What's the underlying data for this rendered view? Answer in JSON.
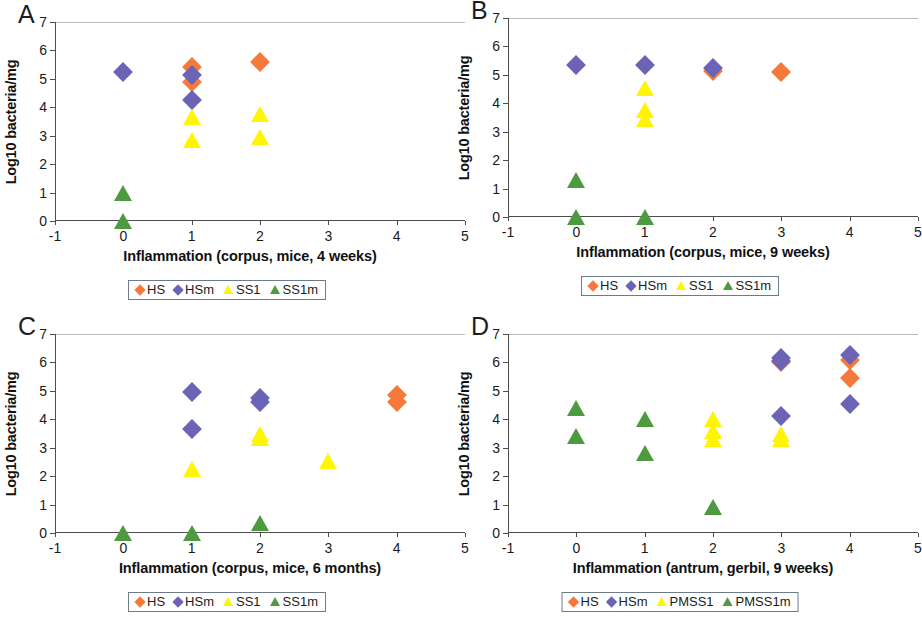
{
  "figure": {
    "panel_letters": [
      "A",
      "B",
      "C",
      "D"
    ]
  },
  "colors": {
    "HS": "#F4793B",
    "HSm": "#6B63B5",
    "SS1": "#FFF500",
    "SS1m": "#4E9A3F",
    "axis": "#4d4d4d",
    "legend_border": "#6b7b8c"
  },
  "axes": {
    "ylabel": "Log10 bacteria/mg",
    "yticks": [
      0,
      1,
      2,
      3,
      4,
      5,
      6,
      7
    ],
    "ylim": [
      0,
      7
    ],
    "xticks": [
      -1,
      0,
      1,
      2,
      3,
      4,
      5
    ],
    "xlim": [
      -1,
      5
    ]
  },
  "chart_data": [
    {
      "type": "scatter",
      "panel": "A",
      "title": "",
      "xlabel": "Inflammation (corpus, mice, 4 weeks)",
      "ylabel": "Log10 bacteria/mg",
      "xlim": [
        -1,
        5
      ],
      "ylim": [
        0,
        7
      ],
      "xticks": [
        -1,
        0,
        1,
        2,
        3,
        4,
        5
      ],
      "yticks": [
        0,
        1,
        2,
        3,
        4,
        5,
        6,
        7
      ],
      "grid": false,
      "legend_position": "below",
      "series": [
        {
          "name": "HS",
          "marker": "diamond",
          "color": "#F4793B",
          "points": [
            [
              1,
              5.4
            ],
            [
              1,
              4.9
            ],
            [
              2,
              5.6
            ]
          ]
        },
        {
          "name": "HSm",
          "marker": "diamond",
          "color": "#6B63B5",
          "points": [
            [
              0,
              5.25
            ],
            [
              1,
              5.15
            ],
            [
              1,
              4.25
            ]
          ]
        },
        {
          "name": "SS1",
          "marker": "triangle",
          "color": "#FFF500",
          "points": [
            [
              1,
              3.65
            ],
            [
              1,
              2.85
            ],
            [
              2,
              3.75
            ],
            [
              2,
              2.95
            ]
          ]
        },
        {
          "name": "SS1m",
          "marker": "triangle",
          "color": "#4E9A3F",
          "points": [
            [
              0,
              1.0
            ],
            [
              0,
              0.0
            ]
          ]
        }
      ]
    },
    {
      "type": "scatter",
      "panel": "B",
      "title": "",
      "xlabel": "Inflammation (corpus, mice, 9 weeks)",
      "ylabel": "Log10 bacteria/mg",
      "xlim": [
        -1,
        5
      ],
      "ylim": [
        0,
        7
      ],
      "xticks": [
        -1,
        0,
        1,
        2,
        3,
        4,
        5
      ],
      "yticks": [
        0,
        1,
        2,
        3,
        4,
        5,
        6,
        7
      ],
      "grid": false,
      "legend_position": "below",
      "series": [
        {
          "name": "HS",
          "marker": "diamond",
          "color": "#F4793B",
          "points": [
            [
              2,
              5.15
            ],
            [
              3,
              5.1
            ]
          ]
        },
        {
          "name": "HSm",
          "marker": "diamond",
          "color": "#6B63B5",
          "points": [
            [
              0,
              5.35
            ],
            [
              1,
              5.35
            ],
            [
              2,
              5.25
            ]
          ]
        },
        {
          "name": "SS1",
          "marker": "triangle",
          "color": "#FFF500",
          "points": [
            [
              1,
              4.55
            ],
            [
              1,
              3.75
            ],
            [
              1,
              3.45
            ]
          ]
        },
        {
          "name": "SS1m",
          "marker": "triangle",
          "color": "#4E9A3F",
          "points": [
            [
              0,
              1.3
            ],
            [
              0,
              0.0
            ],
            [
              1,
              0.0
            ]
          ]
        }
      ]
    },
    {
      "type": "scatter",
      "panel": "C",
      "title": "",
      "xlabel": "Inflammation (corpus, mice, 6 months)",
      "ylabel": "Log10 bacteria/mg",
      "xlim": [
        -1,
        5
      ],
      "ylim": [
        0,
        7
      ],
      "xticks": [
        -1,
        0,
        1,
        2,
        3,
        4,
        5
      ],
      "yticks": [
        0,
        1,
        2,
        3,
        4,
        5,
        6,
        7
      ],
      "grid": false,
      "legend_position": "below",
      "series": [
        {
          "name": "HS",
          "marker": "diamond",
          "color": "#F4793B",
          "points": [
            [
              4,
              4.85
            ],
            [
              4,
              4.6
            ]
          ]
        },
        {
          "name": "HSm",
          "marker": "diamond",
          "color": "#6B63B5",
          "points": [
            [
              1,
              4.95
            ],
            [
              1,
              3.65
            ],
            [
              2,
              4.75
            ],
            [
              2,
              4.6
            ]
          ]
        },
        {
          "name": "SS1",
          "marker": "triangle",
          "color": "#FFF500",
          "points": [
            [
              1,
              2.25
            ],
            [
              2,
              3.5
            ],
            [
              2,
              3.35
            ],
            [
              3,
              2.55
            ]
          ]
        },
        {
          "name": "SS1m",
          "marker": "triangle",
          "color": "#4E9A3F",
          "points": [
            [
              0,
              0.0
            ],
            [
              1,
              0.0
            ],
            [
              2,
              0.35
            ]
          ]
        }
      ]
    },
    {
      "type": "scatter",
      "panel": "D",
      "title": "",
      "xlabel": "Inflammation (antrum, gerbil, 9 weeks)",
      "ylabel": "Log10 bacteria/mg",
      "xlim": [
        -1,
        5
      ],
      "ylim": [
        0,
        7
      ],
      "xticks": [
        -1,
        0,
        1,
        2,
        3,
        4,
        5
      ],
      "yticks": [
        0,
        1,
        2,
        3,
        4,
        5,
        6,
        7
      ],
      "grid": false,
      "legend_position": "below",
      "series": [
        {
          "name": "HS",
          "marker": "diamond",
          "color": "#F4793B",
          "points": [
            [
              3,
              6.0
            ],
            [
              4,
              6.1
            ],
            [
              4,
              5.45
            ]
          ]
        },
        {
          "name": "HSm",
          "marker": "diamond",
          "color": "#6B63B5",
          "points": [
            [
              3,
              6.15
            ],
            [
              3,
              6.05
            ],
            [
              3,
              4.1
            ],
            [
              4,
              6.25
            ],
            [
              4,
              4.55
            ]
          ]
        },
        {
          "name": "PMSS1",
          "marker": "triangle",
          "color": "#FFF500",
          "points": [
            [
              2,
              4.0
            ],
            [
              2,
              3.6
            ],
            [
              2,
              3.3
            ],
            [
              3,
              3.5
            ],
            [
              3,
              3.3
            ]
          ]
        },
        {
          "name": "PMSS1m",
          "marker": "triangle",
          "color": "#4E9A3F",
          "points": [
            [
              0,
              4.4
            ],
            [
              0,
              3.4
            ],
            [
              1,
              4.0
            ],
            [
              1,
              2.8
            ],
            [
              2,
              0.9
            ]
          ]
        }
      ]
    }
  ]
}
